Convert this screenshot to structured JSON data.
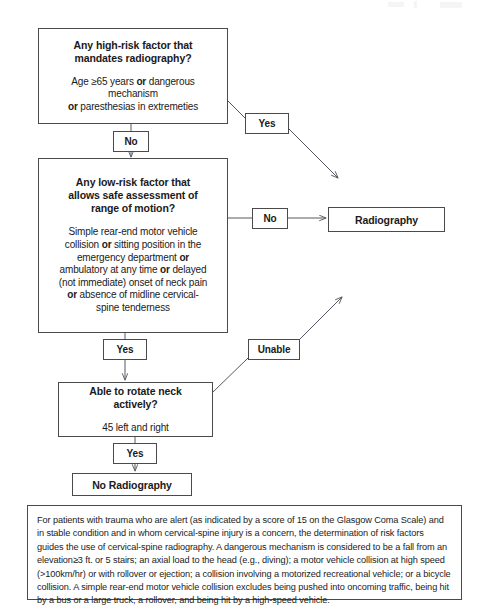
{
  "diagram": {
    "line_color": "#4a4a4a"
  },
  "nodes": {
    "high_risk": {
      "title_line1": "Any high-risk factor that",
      "title_line2": "mandates radiography?",
      "body_line1_a": "Age ≥65 years ",
      "body_line1_b": "or",
      "body_line1_c": " dangerous",
      "body_line2": "mechanism",
      "body_line3_a": "or",
      "body_line3_b": " paresthesias in extremeties"
    },
    "low_risk": {
      "title_line1": "Any low-risk factor that",
      "title_line2": "allows safe assessment of",
      "title_line3": "range of motion?",
      "body_line1": "Simple rear-end motor vehicle",
      "body_line2_a": "collision ",
      "body_line2_b": "or",
      "body_line2_c": " sitting position in the",
      "body_line3_a": "emergency department ",
      "body_line3_b": "or",
      "body_line4_a": "ambulatory at any time ",
      "body_line4_b": "or",
      "body_line4_c": " delayed",
      "body_line5": "(not immediate) onset of neck pain",
      "body_line6_a": "or",
      "body_line6_b": " absence of midline cervical-",
      "body_line7": "spine tenderness"
    },
    "rotate_neck": {
      "title": "Able to rotate neck actively?",
      "body": "45 left and right"
    },
    "radiography": {
      "label": "Radiography"
    },
    "no_radiography": {
      "label": "No Radiography"
    }
  },
  "edge_labels": {
    "yes_high_risk": "Yes",
    "no_high_risk": "No",
    "no_low_risk": "No",
    "yes_low_risk": "Yes",
    "unable_rotate": "Unable",
    "yes_rotate": "Yes"
  },
  "footnote": {
    "line1": "For patients with trauma who are alert (as indicated by a score of 15 on the Glasgow Coma Scale) and in",
    "line2": "stable condition and in whom cervical-spine injury is a concern, the determination of risk factors guides the",
    "line3": "use of cervical-spine radiography. A dangerous mechanism is considered to be a fall from an elevation≥3 ft.",
    "line4": "or 5 stairs; an axial load to the head (e.g., diving); a motor vehicle collision at high speed (>100km/hr) or with",
    "line5": "rollover or ejection; a collision involving a motorized recreational vehicle; or a bicycle collision.  A simple",
    "line6": "rear-end motor vehicle collision excludes being pushed into oncoming traffic, being hit by a bus or a large",
    "line7": "truck, a rollover, and being hit by a high-speed vehicle."
  }
}
